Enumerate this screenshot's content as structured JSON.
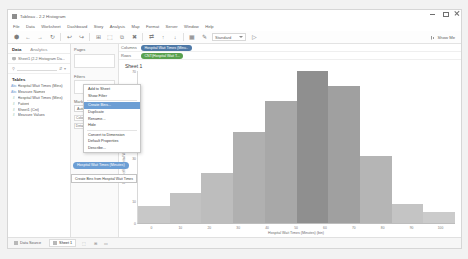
{
  "window": {
    "title": "Tableau - 2.2 Histogram",
    "controls": {
      "minimize": "minimize-icon",
      "maximize": "maximize-icon",
      "close": "close-icon"
    }
  },
  "menubar": {
    "items": [
      "File",
      "Data",
      "Worksheet",
      "Dashboard",
      "Story",
      "Analysis",
      "Map",
      "Format",
      "Server",
      "Window",
      "Help"
    ]
  },
  "toolbar": {
    "buttons": [
      {
        "name": "tableau-logo-icon",
        "glyph": "⬢"
      },
      {
        "name": "back-icon",
        "glyph": "←"
      },
      {
        "name": "forward-icon",
        "glyph": "→"
      },
      {
        "name": "save-icon",
        "glyph": "↻"
      },
      {
        "name": "undo-icon",
        "glyph": "↩"
      },
      {
        "name": "redo-icon",
        "glyph": "↪"
      },
      {
        "name": "new-data-source-icon",
        "glyph": "⊞"
      },
      {
        "name": "new-worksheet-icon",
        "glyph": "⬚"
      },
      {
        "name": "duplicate-icon",
        "glyph": "⧉"
      },
      {
        "name": "clear-sheet-icon",
        "glyph": "✖"
      },
      {
        "name": "swap-icon",
        "glyph": "⇄"
      },
      {
        "name": "sort-ascending-icon",
        "glyph": "↑"
      },
      {
        "name": "sort-descending-icon",
        "glyph": "↓"
      },
      {
        "name": "group-icon",
        "glyph": "▦"
      },
      {
        "name": "highlight-icon",
        "glyph": "✎"
      },
      {
        "name": "presentation-icon",
        "glyph": "▷"
      }
    ],
    "fit_label": "Standard",
    "show_me_label": "Show Me",
    "show_me_icon": "show-me-icon"
  },
  "data_pane": {
    "tabs": [
      {
        "label": "Data",
        "active": true
      },
      {
        "label": "Analytics",
        "active": false
      }
    ],
    "source_icon": "data-source-icon",
    "source_name": "Sheet1 (2.2 Histogram Da...",
    "search_icon": "search-icon",
    "sort_icon": "sort-icon",
    "menu_icon": "more-options-icon",
    "section_title": "Tables",
    "fields": [
      {
        "icon": "abc-icon",
        "type": "dimension",
        "label": "Hospital Wait Times (Mins)"
      },
      {
        "icon": "abc-icon",
        "type": "dimension",
        "label": "Measure Names"
      },
      {
        "icon": "hash-icon",
        "type": "measure",
        "label": "Hospital Wait Times (Mins)"
      },
      {
        "icon": "hash-icon",
        "type": "measure",
        "label": "Patient"
      },
      {
        "icon": "hash-icon",
        "type": "measure",
        "label": "Sheet1 (Cnt)"
      },
      {
        "icon": "hash-icon",
        "type": "measure",
        "label": "Measure Values"
      }
    ]
  },
  "context_menu": {
    "items": [
      {
        "label": "Add to Sheet",
        "highlighted": false
      },
      {
        "label": "Show Filter",
        "highlighted": false
      },
      {
        "label": "Create Bins...",
        "highlighted": true
      },
      {
        "label": "Duplicate",
        "highlighted": false
      },
      {
        "label": "Rename...",
        "highlighted": false
      },
      {
        "label": "Hide",
        "highlighted": false
      },
      {
        "label": "Convert to Dimension",
        "highlighted": false
      },
      {
        "label": "Default Properties",
        "highlighted": false
      },
      {
        "label": "Describe...",
        "highlighted": false
      }
    ],
    "drag_pill_label": "Hospital Wait Times (Minutes)",
    "hint_label": "Create Bins from Hospital Wait Times"
  },
  "shelves": {
    "pages_label": "Pages",
    "filters_label": "Filters",
    "marks_label": "Marks",
    "marks_type": "Automatic",
    "marks_buttons": [
      {
        "name": "color-button",
        "label": "Color"
      },
      {
        "name": "size-button",
        "label": "Size"
      },
      {
        "name": "label-button",
        "label": "Label"
      },
      {
        "name": "detail-button",
        "label": "Detail"
      },
      {
        "name": "tooltip-button",
        "label": "Tooltip"
      }
    ],
    "columns_label": "Columns",
    "rows_label": "Rows",
    "columns_pill": "Hospital Wait Times (Minu..",
    "rows_pill": "CNT(Hospital Wait T..."
  },
  "worksheet": {
    "title": "Sheet 1"
  },
  "statusbar": {
    "tabs": [
      {
        "label": "Data Source",
        "icon": "data-source-tab-icon",
        "active": false
      },
      {
        "label": "Sheet 1",
        "icon": "worksheet-tab-icon",
        "active": true
      }
    ],
    "new_buttons": [
      {
        "name": "new-worksheet-button",
        "glyph": "⬚"
      },
      {
        "name": "new-dashboard-button",
        "glyph": "⊞"
      },
      {
        "name": "new-story-button",
        "glyph": "▭"
      }
    ]
  },
  "chart_data": {
    "type": "bar",
    "title": "Sheet 1",
    "xlabel": "Hospital Wait Times (Minutes) (bin)",
    "ylabel": "Count of Hospital Wait Times (Minutes)",
    "categories": [
      "0",
      "10",
      "20",
      "30",
      "40",
      "50",
      "60",
      "70",
      "80",
      "90"
    ],
    "values": [
      8,
      14,
      23,
      42,
      56,
      70,
      63,
      31,
      9,
      5
    ],
    "ylim": [
      0,
      70
    ],
    "yticks": [
      "0",
      "10",
      "20",
      "30",
      "40",
      "50",
      "60",
      "70"
    ],
    "xticks": [
      "0",
      "10",
      "20",
      "30",
      "40",
      "50",
      "60",
      "70",
      "80",
      "90",
      "100"
    ],
    "bar_colors": [
      "#c8c8c8",
      "#c2c2c2",
      "#bdbdbd",
      "#b0b0b0",
      "#a8a8a8",
      "#8f8f8f",
      "#a0a0a0",
      "#b5b5b5",
      "#c4c4c4",
      "#cbcbcb"
    ],
    "grid": false,
    "legend": "none"
  }
}
